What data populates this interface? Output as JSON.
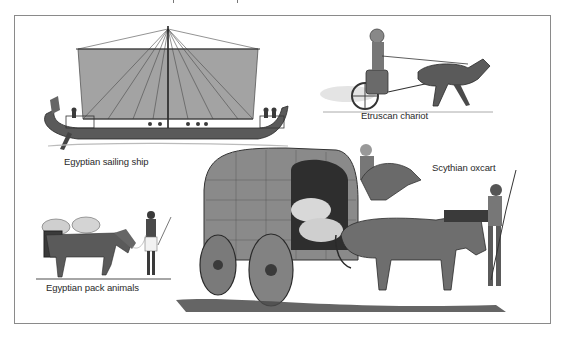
{
  "figure": {
    "labels": {
      "ship": "Egyptian sailing ship",
      "chariot": "Etruscan chariot",
      "oxcart": "Scythian oxcart",
      "pack": "Egyptian pack animals"
    },
    "illustrations": [
      {
        "id": "ship",
        "subject": "Egyptian sailing ship"
      },
      {
        "id": "chariot",
        "subject": "Etruscan chariot"
      },
      {
        "id": "oxcart",
        "subject": "Scythian oxcart"
      },
      {
        "id": "pack",
        "subject": "Egyptian pack animals"
      }
    ],
    "colors": {
      "border": "#8a8a8a",
      "label": "#2a2a2a",
      "ink": "#3a3a3a",
      "sail": "#9a9a9a"
    }
  }
}
